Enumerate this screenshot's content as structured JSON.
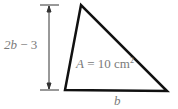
{
  "diagram": {
    "shape": "triangle",
    "height_label": {
      "var": "2b",
      "op": "−",
      "const": "3"
    },
    "base_label": "b",
    "area_label": {
      "prefix": "A",
      "eq": "= 10 cm",
      "exp": "2"
    },
    "colors": {
      "stroke": "#111111",
      "text": "#7a7a7a",
      "dim": "#333333"
    }
  }
}
